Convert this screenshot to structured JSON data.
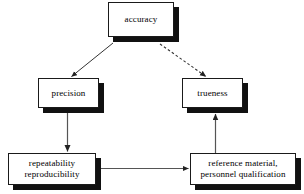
{
  "diagram": {
    "background_color": "#ffffff",
    "line_color": "#333333",
    "shadow_color": "#111111",
    "border_color": "#1a1a1a",
    "nodes": {
      "accuracy": {
        "label": "accuracy"
      },
      "precision": {
        "label": "precision"
      },
      "trueness": {
        "label": "trueness"
      },
      "repeatability": {
        "label": "repeatability\nreproducibility"
      },
      "reference": {
        "label": "reference material,\npersonnel qualification"
      }
    },
    "edges": [
      {
        "id": "accuracy-to-precision",
        "from": "accuracy",
        "to": "precision",
        "style": "solid",
        "arrow": "end"
      },
      {
        "id": "accuracy-to-trueness",
        "from": "accuracy",
        "to": "trueness",
        "style": "dashed",
        "arrow": "end"
      },
      {
        "id": "precision-to-repeatability",
        "from": "precision",
        "to": "repeatability",
        "style": "solid",
        "arrow": "end"
      },
      {
        "id": "repeatability-to-reference",
        "from": "repeatability",
        "to": "reference",
        "style": "solid",
        "arrow": "end"
      },
      {
        "id": "reference-to-trueness",
        "from": "reference",
        "to": "trueness",
        "style": "solid",
        "arrow": "end"
      }
    ]
  }
}
